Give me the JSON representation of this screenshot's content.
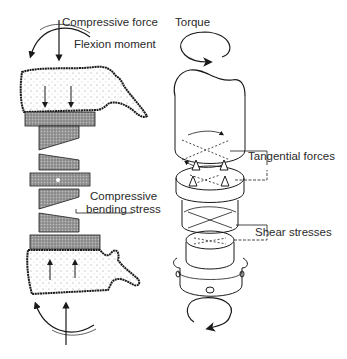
{
  "figure": {
    "labels": {
      "compressive_force": "Compressive force",
      "flexion_moment": "Flexion moment",
      "torque": "Torque",
      "tangential_forces": "Tangential forces",
      "compressive_bending_stress_line1": "Compressive",
      "compressive_bending_stress_line2": "bending stress",
      "shear_stresses": "Shear stresses"
    },
    "colors": {
      "line": "#1a1a1a",
      "bone_stipple": "#6a6a6a",
      "disc_fill": "#8a8a8a",
      "text": "#2a2a2a"
    }
  }
}
